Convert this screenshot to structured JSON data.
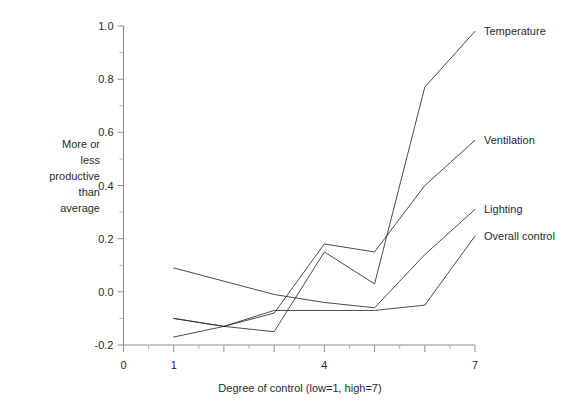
{
  "chart_data": {
    "type": "line",
    "title": "",
    "subtitle": "",
    "xlabel": "Degree of control (low=1, high=7)",
    "ylabel": "More or less productive than average",
    "ylabel_lines": [
      "More or",
      "less",
      "productive",
      "than",
      "average"
    ],
    "x": [
      1,
      2,
      3,
      4,
      5,
      6,
      7
    ],
    "xlim": [
      0,
      7
    ],
    "ylim": [
      -0.2,
      1.0
    ],
    "grid": false,
    "legend_position": "right-inline",
    "xticks_labeled": [
      "0",
      "1",
      "4",
      "7"
    ],
    "xtick_values": [
      0,
      1,
      4,
      7
    ],
    "xtick_minor_count": 13,
    "yticks_labeled": [
      "1.0",
      "0.8",
      "0.6",
      "0.4",
      "0.2",
      "0.0",
      "-0.2"
    ],
    "ytick_values": [
      1.0,
      0.8,
      0.6,
      0.4,
      0.2,
      0.0,
      -0.2
    ],
    "series": [
      {
        "name": "Temperature",
        "label": "Temperature",
        "color": "#2b2b2b",
        "values": [
          -0.17,
          -0.13,
          -0.15,
          0.15,
          0.03,
          0.77,
          0.98
        ]
      },
      {
        "name": "Ventilation",
        "label": "Ventilation",
        "color": "#2b2b2b",
        "values": [
          -0.1,
          -0.13,
          -0.08,
          0.18,
          0.15,
          0.4,
          0.57
        ]
      },
      {
        "name": "Lighting",
        "label": "Lighting",
        "color": "#2b2b2b",
        "values": [
          0.09,
          0.04,
          -0.01,
          -0.04,
          -0.06,
          0.14,
          0.31
        ]
      },
      {
        "name": "Overall control",
        "label": "Overall control",
        "color": "#2b2b2b",
        "values": [
          -0.1,
          -0.13,
          -0.07,
          -0.07,
          -0.07,
          -0.05,
          0.21
        ]
      }
    ]
  },
  "axes": {
    "y_axis_name": "vertical-axis",
    "x_axis_name": "horizontal-axis"
  }
}
